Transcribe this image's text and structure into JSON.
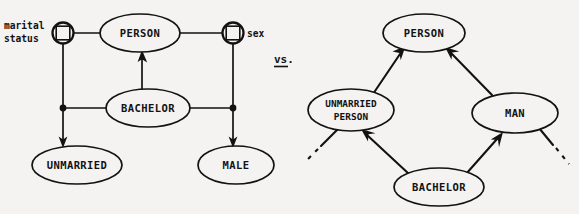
{
  "figure": {
    "caption_separator": "vs.",
    "background_color": "#f4f3f1",
    "ink_color": "#121212"
  },
  "left_diagram": {
    "name": "attribute-value-network",
    "nodes": [
      {
        "id": "person",
        "label": "PERSON",
        "cx": 140,
        "cy": 33,
        "rx": 40,
        "ry": 19
      },
      {
        "id": "bachelor",
        "label": "BACHELOR",
        "cx": 148,
        "cy": 108,
        "rx": 42,
        "ry": 19
      },
      {
        "id": "unmarried",
        "label": "UNMARRIED",
        "cx": 77,
        "cy": 165,
        "rx": 44,
        "ry": 19
      },
      {
        "id": "male",
        "label": "MALE",
        "cx": 236,
        "cy": 165,
        "rx": 38,
        "ry": 19
      }
    ],
    "attribute_nodes": [
      {
        "id": "marital-status",
        "label": "marital status",
        "label_lines": [
          "marital",
          "status"
        ],
        "cx": 63,
        "cy": 33,
        "r": 10
      },
      {
        "id": "sex",
        "label": "sex",
        "label_lines": [
          "sex"
        ],
        "cx": 233,
        "cy": 33,
        "r": 10
      }
    ],
    "junctions": [
      {
        "id": "junction-left",
        "cx": 63,
        "cy": 108,
        "r": 3.2
      },
      {
        "id": "junction-right",
        "cx": 233,
        "cy": 108,
        "r": 3.2
      }
    ],
    "edges": [
      {
        "id": "marital-status-to-person",
        "type": "plain"
      },
      {
        "id": "person-to-sex",
        "type": "plain"
      },
      {
        "id": "marital-status-to-unmarried",
        "type": "arrow"
      },
      {
        "id": "sex-to-male",
        "type": "arrow"
      },
      {
        "id": "bachelor-to-person",
        "type": "arrow"
      },
      {
        "id": "bachelor-to-junction-left",
        "type": "plain"
      },
      {
        "id": "bachelor-to-junction-right",
        "type": "plain"
      }
    ]
  },
  "right_diagram": {
    "name": "isa-hierarchy-network",
    "nodes": [
      {
        "id": "person",
        "label": "PERSON",
        "cx": 424,
        "cy": 33,
        "rx": 40,
        "ry": 19
      },
      {
        "id": "unmarried-person",
        "label": "UNMARRIED PERSON",
        "label_lines": [
          "UNMARRIED",
          "PERSON"
        ],
        "cx": 351,
        "cy": 110,
        "rx": 42,
        "ry": 20
      },
      {
        "id": "man",
        "label": "MAN",
        "cx": 515,
        "cy": 113,
        "rx": 42,
        "ry": 20
      },
      {
        "id": "bachelor",
        "label": "BACHELOR",
        "cx": 439,
        "cy": 187,
        "rx": 44,
        "ry": 19
      }
    ],
    "edges": [
      {
        "id": "unmarried-person-to-person",
        "type": "arrow"
      },
      {
        "id": "man-to-person",
        "type": "arrow"
      },
      {
        "id": "bachelor-to-unmarried-person",
        "type": "arrow"
      },
      {
        "id": "bachelor-to-man",
        "type": "arrow"
      },
      {
        "id": "unmarried-person-dashed-tail",
        "type": "dashed"
      },
      {
        "id": "man-dashed-tail",
        "type": "dashed"
      }
    ]
  }
}
